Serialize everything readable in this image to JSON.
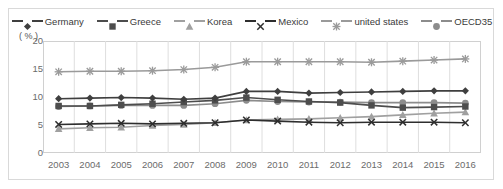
{
  "axis": {
    "unit_label": "( % )",
    "y_ticks": [
      "20",
      "15",
      "10",
      "5",
      "0"
    ],
    "x_ticks": [
      "2003",
      "2004",
      "2005",
      "2006",
      "2007",
      "2008",
      "2009",
      "2010",
      "2011",
      "2012",
      "2013",
      "2014",
      "2015",
      "2016"
    ]
  },
  "legend": {
    "position": "top-center",
    "items": [
      {
        "label": "Germany",
        "marker": "diamond-marker",
        "color": "#3f3f3f"
      },
      {
        "label": "Greece",
        "marker": "square-marker",
        "color": "#4d4d4d"
      },
      {
        "label": "Korea",
        "marker": "triangle-marker",
        "color": "#a0a0a0"
      },
      {
        "label": "Mexico",
        "marker": "x-marker",
        "color": "#2e2e2e"
      },
      {
        "label": "united states",
        "marker": "star-marker",
        "color": "#9a9a9a"
      },
      {
        "label": "OECD35",
        "marker": "circle-marker",
        "color": "#8c8c8c"
      }
    ]
  },
  "chart_data": {
    "type": "line",
    "title": "",
    "xlabel": "",
    "ylabel": "( % )",
    "ylim": [
      0,
      20
    ],
    "yticks": [
      0,
      5,
      10,
      15,
      20
    ],
    "grid": "vertical",
    "legend_position": "top-center",
    "categories": [
      "2003",
      "2004",
      "2005",
      "2006",
      "2007",
      "2008",
      "2009",
      "2010",
      "2011",
      "2012",
      "2013",
      "2014",
      "2015",
      "2016"
    ],
    "series": [
      {
        "name": "Germany",
        "marker": "diamond",
        "color": "#3f3f3f",
        "values": [
          9.7,
          9.8,
          9.9,
          9.8,
          9.6,
          9.8,
          11.0,
          11.0,
          10.7,
          10.8,
          10.9,
          11.0,
          11.1,
          11.1
        ]
      },
      {
        "name": "Greece",
        "marker": "square",
        "color": "#4d4d4d",
        "values": [
          8.4,
          8.4,
          8.6,
          8.8,
          9.1,
          9.4,
          9.9,
          9.5,
          9.2,
          9.0,
          8.5,
          8.1,
          8.2,
          8.3
        ]
      },
      {
        "name": "Korea",
        "marker": "triangle",
        "color": "#a0a0a0",
        "values": [
          4.3,
          4.5,
          4.6,
          4.9,
          5.1,
          5.4,
          5.9,
          6.0,
          6.1,
          6.3,
          6.5,
          6.8,
          7.1,
          7.3
        ]
      },
      {
        "name": "Mexico",
        "marker": "x",
        "color": "#2e2e2e",
        "values": [
          5.1,
          5.2,
          5.3,
          5.2,
          5.3,
          5.4,
          5.9,
          5.7,
          5.5,
          5.4,
          5.5,
          5.5,
          5.5,
          5.4
        ]
      },
      {
        "name": "united states",
        "marker": "star",
        "color": "#9a9a9a",
        "values": [
          14.5,
          14.6,
          14.6,
          14.7,
          14.9,
          15.3,
          16.3,
          16.3,
          16.3,
          16.3,
          16.2,
          16.4,
          16.6,
          16.8
        ]
      },
      {
        "name": "OECD35",
        "marker": "circle",
        "color": "#8c8c8c",
        "values": [
          8.3,
          8.4,
          8.5,
          8.5,
          8.5,
          8.8,
          9.4,
          9.2,
          9.1,
          9.1,
          9.0,
          9.0,
          9.0,
          8.9
        ]
      }
    ]
  }
}
